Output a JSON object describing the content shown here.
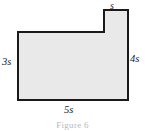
{
  "figure": {
    "kind": "composite-rectilinear-polygon",
    "fill_color": "#e9e9e9",
    "stroke_color": "#1a1a1a",
    "background_color": "#ffffff",
    "caption": "Figure 6",
    "labels": {
      "top": "s",
      "left": "3s",
      "right": "4s",
      "bottom": "5s"
    },
    "vertices": [
      [
        18,
        32
      ],
      [
        104,
        32
      ],
      [
        104,
        10
      ],
      [
        128,
        10
      ],
      [
        128,
        100
      ],
      [
        18,
        100
      ]
    ],
    "dimensions": [
      {
        "name": "tab-width",
        "label": "s",
        "side": "top",
        "length_expr": "s"
      },
      {
        "name": "left-height",
        "label": "3s",
        "side": "left",
        "length_expr": "3s"
      },
      {
        "name": "right-height",
        "label": "4s",
        "side": "right",
        "length_expr": "4s"
      },
      {
        "name": "base-width",
        "label": "5s",
        "side": "bottom",
        "length_expr": "5s"
      }
    ]
  }
}
